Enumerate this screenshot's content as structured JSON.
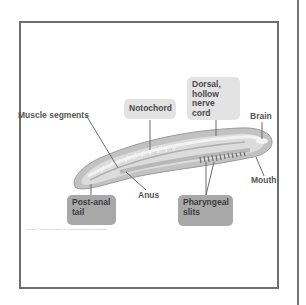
{
  "diagram": {
    "labels": {
      "muscle_segments": "Muscle segments",
      "notochord": "Notochord",
      "dorsal_nerve_cord": [
        "Dorsal,",
        "hollow",
        "nerve cord"
      ],
      "brain": "Brain",
      "mouth": "Mouth",
      "anus": "Anus",
      "post_anal_tail": [
        "Post-anal",
        "tail"
      ],
      "pharyngeal_slits": [
        "Pharyngeal",
        "slits"
      ]
    },
    "caption": "Copyright © Pearson Education, Inc., publishing as Benjamin Cummings"
  },
  "colors": {
    "frame_border": "#6e6e6e",
    "light_box": "#e3e3e3",
    "dark_box": "#a8a8a8",
    "body_outer": "#bdbdbd",
    "body_inner": "#d9d9d9",
    "leader_line": "#6a6a6a"
  }
}
